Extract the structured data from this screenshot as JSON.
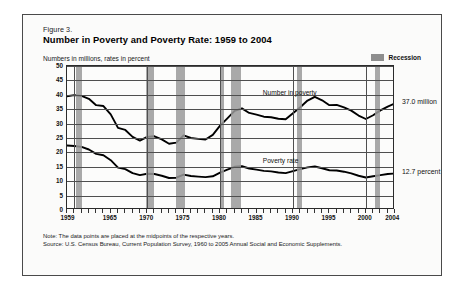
{
  "figure": {
    "number_label": "Figure 3.",
    "title": "Number in Poverty and Poverty Rate:  1959 to 2004",
    "subtitle": "Numbers in millions, rates in percent"
  },
  "legend": {
    "recession_label": "Recession",
    "recession_color": "#9a9a9a"
  },
  "annotations": {
    "number_in_poverty_label": "Number in poverty",
    "poverty_rate_label": "Poverty rate",
    "number_in_poverty_end": "37.0 million",
    "poverty_rate_end": "12.7 percent"
  },
  "notes": {
    "note": "Note:  The data points are placed at the midpoints of the respective years.",
    "source": "Source:  U.S. Census Bureau, Current Population Survey, 1960 to 2005 Annual Social and Economic Supplements."
  },
  "chart_data": {
    "type": "line",
    "title": "Number in Poverty and Poverty Rate:  1959 to 2004",
    "subtitle": "Numbers in millions, rates in percent",
    "xlabel": "",
    "ylabel": "Numbers in millions, rates in percent",
    "xlim": [
      1959,
      2004
    ],
    "ylim": [
      0,
      50
    ],
    "yticks": [
      0,
      5,
      10,
      15,
      20,
      25,
      30,
      35,
      40,
      45,
      50
    ],
    "xticks": [
      1959,
      1965,
      1970,
      1975,
      1980,
      1985,
      1990,
      1995,
      2000,
      2004
    ],
    "xtick_labels": [
      "1959",
      "1965",
      "1970",
      "1975",
      "1980",
      "1985",
      "1990",
      "1995",
      "2000",
      "2004"
    ],
    "grid": "horizontal-and-decade-vertical",
    "legend_position": "top-right",
    "x": [
      1959,
      1960,
      1961,
      1962,
      1963,
      1964,
      1965,
      1966,
      1967,
      1968,
      1969,
      1970,
      1971,
      1972,
      1973,
      1974,
      1975,
      1976,
      1977,
      1978,
      1979,
      1980,
      1981,
      1982,
      1983,
      1984,
      1985,
      1986,
      1987,
      1988,
      1989,
      1990,
      1991,
      1992,
      1993,
      1994,
      1995,
      1996,
      1997,
      1998,
      1999,
      2000,
      2001,
      2002,
      2003,
      2004
    ],
    "series": [
      {
        "name": "Number in poverty",
        "unit": "millions",
        "line_color": "#000000",
        "end_label": "37.0 million",
        "values": [
          39.5,
          39.9,
          39.6,
          38.6,
          36.4,
          36.1,
          33.2,
          28.5,
          27.8,
          25.4,
          24.1,
          25.4,
          25.6,
          24.5,
          23.0,
          23.4,
          25.9,
          25.0,
          24.7,
          24.5,
          26.1,
          29.3,
          31.8,
          34.4,
          35.3,
          33.7,
          33.1,
          32.4,
          32.2,
          31.7,
          31.5,
          33.6,
          35.7,
          38.0,
          39.3,
          38.1,
          36.4,
          36.5,
          35.6,
          34.5,
          32.8,
          31.6,
          32.9,
          34.6,
          35.9,
          37.0
        ]
      },
      {
        "name": "Poverty rate",
        "unit": "percent",
        "line_color": "#000000",
        "end_label": "12.7 percent",
        "values": [
          22.4,
          22.2,
          21.9,
          21.0,
          19.5,
          19.0,
          17.3,
          14.7,
          14.2,
          12.8,
          12.1,
          12.6,
          12.5,
          11.9,
          11.1,
          11.2,
          12.3,
          11.8,
          11.6,
          11.4,
          11.7,
          13.0,
          14.0,
          15.0,
          15.2,
          14.4,
          14.0,
          13.6,
          13.4,
          13.0,
          12.8,
          13.5,
          14.2,
          14.8,
          15.1,
          14.5,
          13.8,
          13.7,
          13.3,
          12.7,
          11.9,
          11.3,
          11.7,
          12.1,
          12.5,
          12.7
        ]
      }
    ],
    "recession_bands": [
      {
        "start": 1960.3,
        "end": 1961.1
      },
      {
        "start": 1969.9,
        "end": 1970.9
      },
      {
        "start": 1973.9,
        "end": 1975.2
      },
      {
        "start": 1980.0,
        "end": 1980.5
      },
      {
        "start": 1981.5,
        "end": 1982.9
      },
      {
        "start": 1990.5,
        "end": 1991.2
      },
      {
        "start": 2001.2,
        "end": 2001.9
      }
    ]
  }
}
